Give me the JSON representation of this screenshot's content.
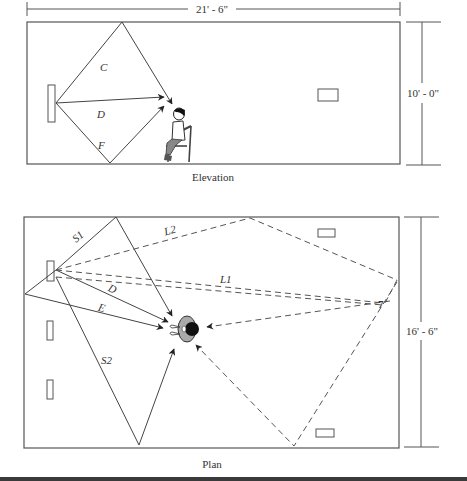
{
  "elevation": {
    "caption": "Elevation",
    "width_dimension": "21' - 6\"",
    "height_dimension": "10' - 0\"",
    "ray_labels": {
      "ceiling": "C",
      "direct": "D",
      "floor": "F"
    }
  },
  "plan": {
    "caption": "Plan",
    "height_dimension": "16' - 6\"",
    "ray_labels": {
      "side1": "S1",
      "side2": "S2",
      "direct": "D",
      "early": "E",
      "late1": "L1",
      "late2": "L2",
      "corner_marker": "7"
    }
  },
  "colors": {
    "line": "#555555",
    "text": "#333333",
    "background": "#ffffff"
  }
}
